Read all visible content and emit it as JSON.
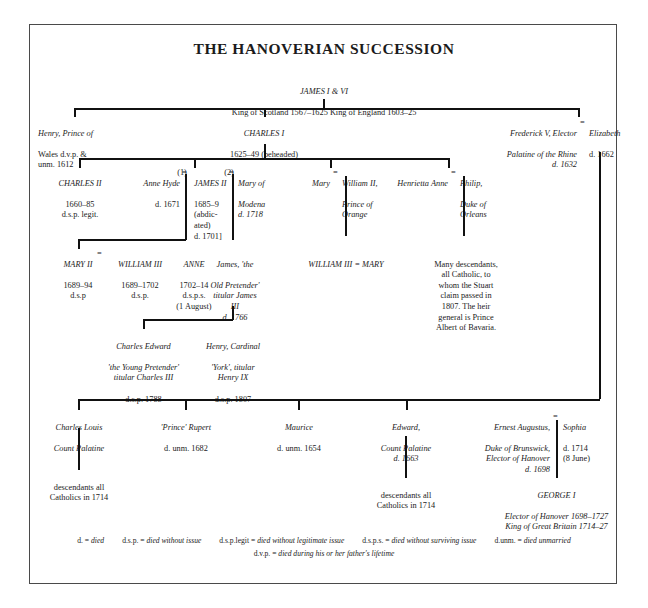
{
  "title": "THE HANOVERIAN SUCCESSION",
  "people": {
    "james1": {
      "name": "JAMES I & VI",
      "detail": "King of Scotland 1567–1625  King of England 1603–25"
    },
    "henry_prince": {
      "name": "Henry, Prince of",
      "detail": "Wales d.v.p. &\nunm. 1612"
    },
    "charles1": {
      "name": "CHARLES I",
      "detail": "1625–49 (beheaded)"
    },
    "frederick5": {
      "name": "Frederick V, Elector",
      "detail": "Palatine of the Rhine\nd. 1632"
    },
    "elizabeth": {
      "name": "Elizabeth",
      "detail": "d. 1662"
    },
    "charles2": {
      "name": "CHARLES II",
      "detail": "1660–85\nd.s.p. legit."
    },
    "anne_hyde": {
      "name": "Anne Hyde",
      "detail": "d. 1671",
      "marriage_order": "(1)"
    },
    "james2": {
      "name": "JAMES II",
      "detail": "1685–9\n(abdic-\nated)\nd. 1701]",
      "marriage_order": "(2)"
    },
    "mary_modena": {
      "name": "Mary of",
      "detail": "Modena\nd. 1718"
    },
    "mary_princess": {
      "name": "Mary"
    },
    "william2": {
      "name": "William II,",
      "detail": "Prince of\nOrange"
    },
    "henrietta_anne": {
      "name": "Henrietta Anne"
    },
    "philip_orleans": {
      "name": "Philip,",
      "detail": "Duke of\nOrleans"
    },
    "mary2": {
      "name": "MARY II",
      "detail": "1689–94\nd.s.p"
    },
    "william3": {
      "name": "WILLIAM III",
      "detail": "1689–1702\nd.s.p."
    },
    "anne": {
      "name": "ANNE",
      "detail": "1702–14\nd.s.p.s.\n(1 August)"
    },
    "old_pretender": {
      "name": "James, 'the",
      "detail": "Old Pretender'\ntitular James\nIII\nd. 1766"
    },
    "william3_mary": {
      "name": "WILLIAM III  =  MARY"
    },
    "stuart_note": {
      "text": "Many descendants,\nall Catholic, to\nwhom the Stuart\nclaim passed in\n1807. The heir\ngeneral is Prince\nAlbert of Bavaria."
    },
    "charles_edward": {
      "name": "Charles Edward",
      "detail": "'the Young Pretender'\ntitular Charles III",
      "note": "d.s.p. 1788"
    },
    "henry_cardinal": {
      "name": "Henry, Cardinal",
      "detail": "'York', titular\nHenry IX",
      "note": "d.s.p. 1807"
    },
    "charles_louis": {
      "name": "Charles Louis",
      "detail": "Count Palatine"
    },
    "prince_rupert": {
      "name": "'Prince' Rupert",
      "detail": "d. unm. 1682"
    },
    "maurice": {
      "name": "Maurice",
      "detail": "d. unm. 1654"
    },
    "edward_palatine": {
      "name": "Edward,",
      "detail": "Count Palatine\nd. 1663"
    },
    "ernest_augustus": {
      "name": "Ernest Augustus,",
      "detail": "Duke of Brunswick,\nElector of Hanover\nd. 1698"
    },
    "sophia": {
      "name": "Sophia",
      "detail": "d. 1714\n(8 June)"
    },
    "descendants_left": {
      "text": "descendants all\nCatholics in 1714"
    },
    "descendants_mid": {
      "text": "descendants all\nCatholics in 1714"
    },
    "george1": {
      "name": "GEORGE I",
      "detail": "Elector of Hanover 1698–1727\nKing of Great Britain 1714–27"
    }
  },
  "marriage_symbol": "=",
  "legend": {
    "row1": [
      {
        "abbr": "d.",
        "eq": "=",
        "meaning": "died"
      },
      {
        "abbr": "d.s.p.",
        "eq": "=",
        "meaning": "died without issue"
      },
      {
        "abbr": "d.s.p.legit",
        "eq": "=",
        "meaning": "died without legitimate issue"
      },
      {
        "abbr": "d.s.p.s.",
        "eq": "=",
        "meaning": "died without surviving issue"
      },
      {
        "abbr": "d.unm.",
        "eq": "=",
        "meaning": "died unmarried"
      }
    ],
    "row2": [
      {
        "abbr": "d.v.p.",
        "eq": "=",
        "meaning": "died during his or her father's lifetime"
      }
    ]
  },
  "colors": {
    "ink": "#1b1b1b",
    "line": "#111111",
    "frame": "#4a4a4a",
    "background": "#ffffff"
  }
}
